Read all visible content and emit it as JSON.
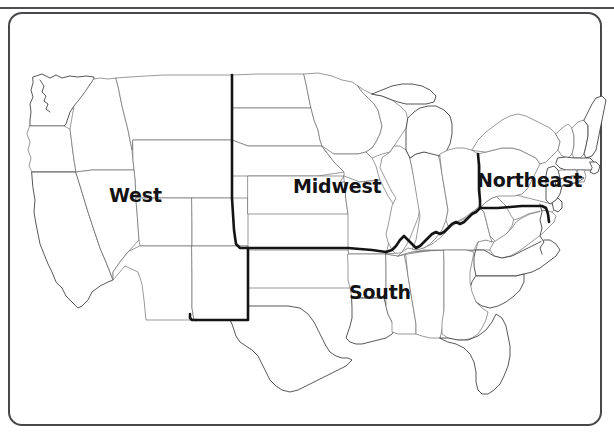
{
  "figure": {
    "title": "",
    "type": "region-map",
    "background_color": "#ffffff",
    "frame": {
      "style": "rounded-rectangle",
      "border_color": "#48484b",
      "border_width_px": 2,
      "corner_radius_px": 14
    },
    "top_rule": {
      "color": "#4f4f52",
      "height_px": 2
    }
  },
  "map": {
    "state_outline_color": "#6e6e70",
    "coast_outline_color": "#3a3a3c",
    "region_boundary_color": "#141416",
    "fill_color": "#ffffff"
  },
  "labels": {
    "west": "West",
    "midwest": "Midwest",
    "northeast": "Northeast",
    "south": "South"
  },
  "regions": [
    {
      "name": "West",
      "label": "West",
      "label_x": 109,
      "label_y": 186
    },
    {
      "name": "Midwest",
      "label": "Midwest",
      "label_x": 293,
      "label_y": 177
    },
    {
      "name": "Northeast",
      "label": "Northeast",
      "label_x": 477,
      "label_y": 171
    },
    {
      "name": "South",
      "label": "South",
      "label_x": 349,
      "label_y": 283
    }
  ]
}
